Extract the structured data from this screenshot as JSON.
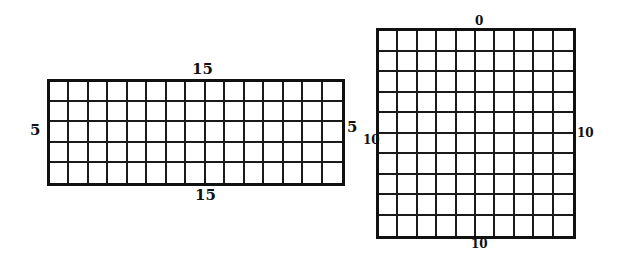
{
  "diagram": {
    "rectangle_grid": {
      "columns": 15,
      "rows": 5,
      "labels": {
        "top": "15",
        "bottom": "15",
        "left": "5",
        "right": "5"
      }
    },
    "square_grid": {
      "columns": 10,
      "rows": 10,
      "labels": {
        "top": "0",
        "bottom": "10",
        "left": "10",
        "right": "10"
      }
    }
  }
}
